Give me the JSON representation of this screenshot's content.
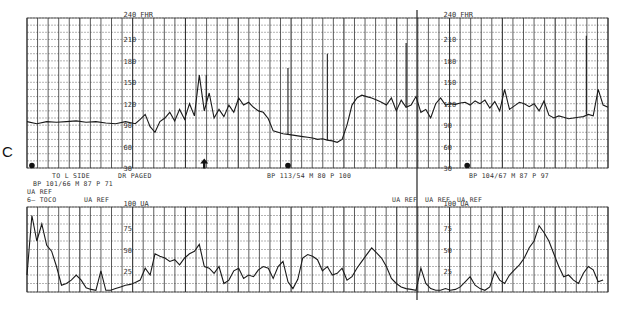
{
  "panel_label": "C",
  "annotations": {
    "to_l_side": "TO L SIDE",
    "dr_paged": "DR PAGED",
    "bp1": "BP 101/66 M 87 P 71",
    "ua_ref_1": "UA REF",
    "toco": "6— TOCO",
    "ua_ref_2": "UA REF",
    "bp2": "BP 113/54 M 80 P 100",
    "bp3": "BP 104/67 M 87 P 97",
    "ua_ref_3": "UA REF",
    "ua_ref_4": "UA REF",
    "ua_ref_5": "UA REF"
  },
  "chart_data": [
    {
      "type": "line",
      "title": "Fetal heart rate",
      "ylabel": "240 FHR",
      "yticks": [
        30,
        60,
        90,
        120,
        150,
        180,
        210,
        240
      ],
      "ylim": [
        30,
        240
      ],
      "grid": true,
      "axis_label_positions_x": [
        100,
        425
      ],
      "x": [
        0,
        10,
        20,
        30,
        40,
        50,
        60,
        70,
        80,
        90,
        100,
        110,
        115,
        120,
        125,
        130,
        135,
        140,
        145,
        150,
        155,
        160,
        165,
        170,
        175,
        180,
        182,
        185,
        190,
        195,
        200,
        205,
        210,
        215,
        220,
        225,
        230,
        235,
        240,
        245,
        250,
        255,
        260,
        265,
        270,
        275,
        280,
        285,
        290,
        295,
        300,
        305,
        310,
        315,
        320,
        325,
        330,
        335,
        340,
        345,
        350,
        355,
        360,
        365,
        370,
        375,
        380,
        385,
        390,
        395,
        400,
        405,
        410,
        415,
        420,
        425,
        430,
        435,
        440,
        445,
        450,
        455,
        460,
        465,
        470,
        475,
        480,
        485,
        490,
        495,
        500,
        505,
        510,
        515,
        520,
        525,
        530,
        535,
        540,
        545,
        550,
        555,
        560,
        565,
        570,
        575,
        580,
        585,
        590
      ],
      "values": [
        95,
        92,
        95,
        94,
        95,
        96,
        94,
        95,
        93,
        92,
        95,
        92,
        98,
        105,
        88,
        80,
        95,
        100,
        108,
        96,
        112,
        98,
        120,
        103,
        160,
        110,
        120,
        135,
        100,
        112,
        102,
        118,
        108,
        128,
        118,
        122,
        115,
        110,
        108,
        99,
        82,
        80,
        78,
        77,
        76,
        75,
        74,
        73,
        72,
        70,
        71,
        69,
        68,
        66,
        70,
        90,
        118,
        128,
        132,
        130,
        128,
        125,
        122,
        118,
        128,
        110,
        125,
        115,
        118,
        130,
        108,
        112,
        100,
        120,
        128,
        118,
        120,
        119,
        121,
        122,
        118,
        124,
        120,
        125,
        114,
        123,
        110,
        140,
        112,
        117,
        122,
        120,
        116,
        120,
        110,
        124,
        104,
        100,
        103,
        101,
        99,
        100,
        101,
        102,
        105,
        103,
        140,
        118,
        115
      ],
      "spikes": [
        {
          "x": 182,
          "value": 160
        },
        {
          "x": 265,
          "value": 170
        },
        {
          "x": 305,
          "value": 190
        },
        {
          "x": 385,
          "value": 205
        },
        {
          "x": 568,
          "value": 215
        }
      ],
      "markers": [
        {
          "type": "dot",
          "x": 5,
          "value": 32
        },
        {
          "type": "arrow",
          "x": 180,
          "value": 32
        },
        {
          "type": "dot",
          "x": 265,
          "value": 32
        },
        {
          "type": "dot",
          "x": 447,
          "value": 32
        }
      ]
    },
    {
      "type": "line",
      "title": "Uterine activity (TOCO)",
      "ylabel": "100 UA",
      "yticks": [
        0,
        25,
        50,
        75,
        100
      ],
      "ylim": [
        0,
        100
      ],
      "grid": true,
      "axis_label_positions_x": [
        100,
        425
      ],
      "x": [
        0,
        5,
        10,
        15,
        20,
        25,
        30,
        35,
        40,
        45,
        50,
        55,
        60,
        65,
        70,
        75,
        80,
        85,
        90,
        95,
        100,
        105,
        110,
        115,
        120,
        125,
        130,
        135,
        140,
        145,
        150,
        155,
        160,
        165,
        170,
        175,
        180,
        185,
        190,
        195,
        200,
        205,
        210,
        215,
        220,
        225,
        230,
        235,
        240,
        245,
        250,
        255,
        260,
        265,
        270,
        275,
        280,
        285,
        290,
        295,
        300,
        305,
        310,
        315,
        320,
        325,
        330,
        335,
        340,
        345,
        350,
        355,
        360,
        365,
        370,
        375,
        380,
        385,
        390,
        395,
        400,
        405,
        410,
        415,
        420,
        425,
        430,
        435,
        440,
        445,
        450,
        455,
        460,
        465,
        470,
        475,
        480,
        485,
        490,
        495,
        500,
        505,
        510,
        515,
        520,
        525,
        530,
        535,
        540,
        545,
        550,
        555,
        560,
        565,
        570,
        575,
        580,
        585
      ],
      "values": [
        20,
        90,
        60,
        80,
        55,
        48,
        30,
        8,
        10,
        14,
        20,
        14,
        5,
        3,
        2,
        25,
        2,
        2,
        4,
        6,
        8,
        9,
        11,
        14,
        28,
        20,
        45,
        42,
        40,
        36,
        38,
        32,
        40,
        45,
        48,
        56,
        30,
        28,
        22,
        30,
        10,
        14,
        25,
        28,
        16,
        20,
        18,
        26,
        30,
        28,
        16,
        30,
        36,
        12,
        4,
        15,
        40,
        44,
        42,
        38,
        25,
        30,
        20,
        22,
        28,
        14,
        18,
        28,
        36,
        44,
        52,
        46,
        40,
        30,
        16,
        10,
        6,
        4,
        3,
        2,
        28,
        10,
        4,
        2,
        2,
        4,
        2,
        3,
        6,
        12,
        18,
        8,
        4,
        2,
        6,
        24,
        14,
        10,
        20,
        26,
        32,
        40,
        52,
        60,
        78,
        70,
        60,
        45,
        30,
        18,
        20,
        14,
        10,
        22,
        30,
        26,
        12,
        14,
        12,
        16,
        14,
        15
      ]
    }
  ]
}
